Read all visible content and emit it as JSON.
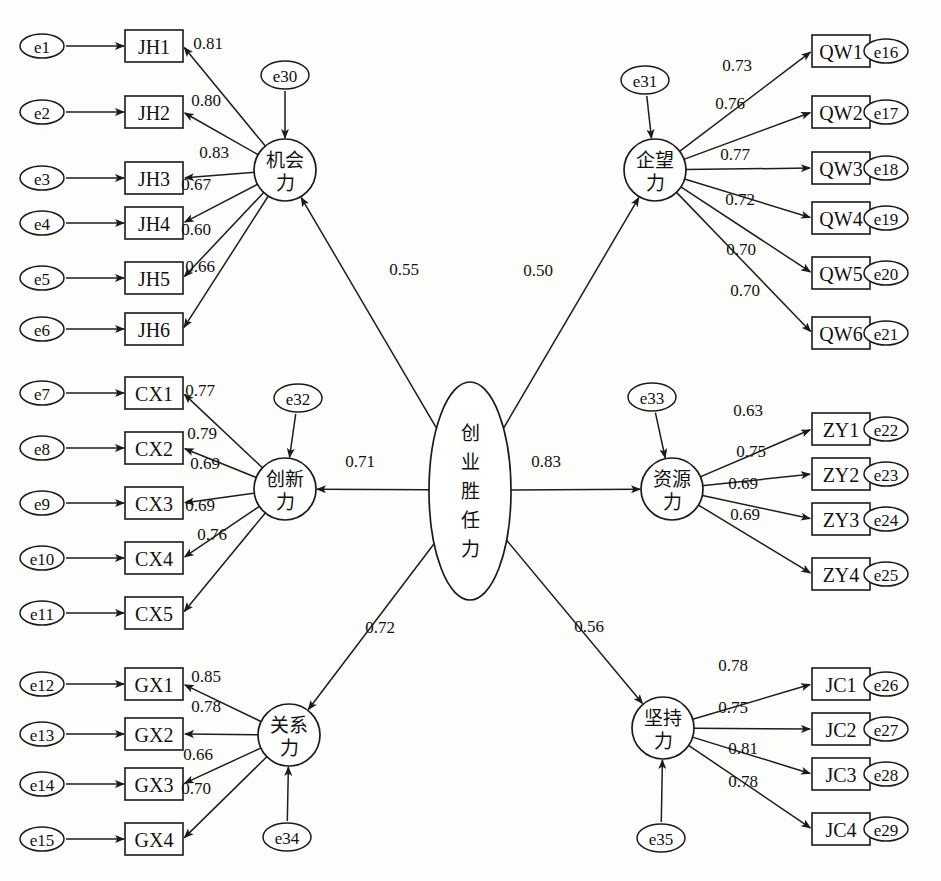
{
  "figure": {
    "type": "structural-equation-model-path-diagram",
    "title_caption": "",
    "center_construct": {
      "id": "center",
      "label": "创业胜任力",
      "label_chars": [
        "创",
        "业",
        "胜",
        "任",
        "力"
      ],
      "shape": "ellipse"
    }
  },
  "constructs": [
    {
      "id": "jh",
      "label": "机会力",
      "label_lines": [
        "机会",
        "力"
      ],
      "shape": "circle",
      "disturbance": "e30",
      "path_from_center": "0.55",
      "side": "left",
      "indicators": [
        {
          "name": "JH1",
          "error": "e1",
          "loading": "0.81"
        },
        {
          "name": "JH2",
          "error": "e2",
          "loading": "0.80"
        },
        {
          "name": "JH3",
          "error": "e3",
          "loading": "0.83"
        },
        {
          "name": "JH4",
          "error": "e4",
          "loading": "0.67"
        },
        {
          "name": "JH5",
          "error": "e5",
          "loading": "0.60"
        },
        {
          "name": "JH6",
          "error": "e6",
          "loading": "0.66"
        }
      ]
    },
    {
      "id": "qw",
      "label": "企望力",
      "label_lines": [
        "企望",
        "力"
      ],
      "shape": "circle",
      "disturbance": "e31",
      "path_from_center": "0.50",
      "side": "right",
      "indicators": [
        {
          "name": "QW1",
          "error": "e16",
          "loading": "0.73"
        },
        {
          "name": "QW2",
          "error": "e17",
          "loading": "0.76"
        },
        {
          "name": "QW3",
          "error": "e18",
          "loading": "0.77"
        },
        {
          "name": "QW4",
          "error": "e19",
          "loading": "0.72"
        },
        {
          "name": "QW5",
          "error": "e20",
          "loading": "0.70"
        },
        {
          "name": "QW6",
          "error": "e21",
          "loading": "0.70"
        }
      ]
    },
    {
      "id": "cx",
      "label": "创新力",
      "label_lines": [
        "创新",
        "力"
      ],
      "shape": "circle",
      "disturbance": "e32",
      "path_from_center": "0.71",
      "side": "left",
      "indicators": [
        {
          "name": "CX1",
          "error": "e7",
          "loading": "0.77"
        },
        {
          "name": "CX2",
          "error": "e8",
          "loading": "0.79"
        },
        {
          "name": "CX3",
          "error": "e9",
          "loading": "0.69"
        },
        {
          "name": "CX4",
          "error": "e10",
          "loading": "0.69"
        },
        {
          "name": "CX5",
          "error": "e11",
          "loading": "0.76"
        }
      ]
    },
    {
      "id": "zy",
      "label": "资源力",
      "label_lines": [
        "资源",
        "力"
      ],
      "shape": "circle",
      "disturbance": "e33",
      "path_from_center": "0.83",
      "side": "right",
      "indicators": [
        {
          "name": "ZY1",
          "error": "e22",
          "loading": "0.63"
        },
        {
          "name": "ZY2",
          "error": "e23",
          "loading": "0.75"
        },
        {
          "name": "ZY3",
          "error": "e24",
          "loading": "0.69"
        },
        {
          "name": "ZY4",
          "error": "e25",
          "loading": "0.69"
        }
      ]
    },
    {
      "id": "gx",
      "label": "关系力",
      "label_lines": [
        "关系",
        "力"
      ],
      "shape": "circle",
      "disturbance": "e34",
      "path_from_center": "0.72",
      "side": "left",
      "indicators": [
        {
          "name": "GX1",
          "error": "e12",
          "loading": "0.85"
        },
        {
          "name": "GX2",
          "error": "e13",
          "loading": "0.78"
        },
        {
          "name": "GX3",
          "error": "e14",
          "loading": "0.66"
        },
        {
          "name": "GX4",
          "error": "e15",
          "loading": "0.70"
        }
      ]
    },
    {
      "id": "jc",
      "label": "坚持力",
      "label_lines": [
        "坚持",
        "力"
      ],
      "shape": "circle",
      "disturbance": "e35",
      "path_from_center": "0.56",
      "side": "right",
      "indicators": [
        {
          "name": "JC1",
          "error": "e26",
          "loading": "0.78"
        },
        {
          "name": "JC2",
          "error": "e27",
          "loading": "0.75"
        },
        {
          "name": "JC3",
          "error": "e28",
          "loading": "0.81"
        },
        {
          "name": "JC4",
          "error": "e29",
          "loading": "0.78"
        }
      ]
    }
  ],
  "chart_data": {
    "type": "diagram",
    "structural_paths": [
      {
        "from": "创业胜任力",
        "to": "机会力",
        "coefficient": 0.55
      },
      {
        "from": "创业胜任力",
        "to": "企望力",
        "coefficient": 0.5
      },
      {
        "from": "创业胜任力",
        "to": "创新力",
        "coefficient": 0.71
      },
      {
        "from": "创业胜任力",
        "to": "资源力",
        "coefficient": 0.83
      },
      {
        "from": "创业胜任力",
        "to": "关系力",
        "coefficient": 0.72
      },
      {
        "from": "创业胜任力",
        "to": "坚持力",
        "coefficient": 0.56
      }
    ]
  }
}
